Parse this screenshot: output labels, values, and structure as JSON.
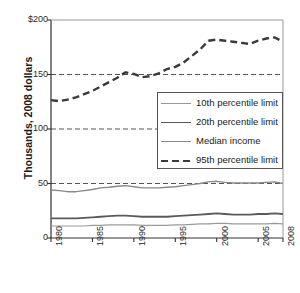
{
  "chart_data": {
    "type": "line",
    "title": "",
    "xlabel": "",
    "ylabel": "Thousands, 2008 dollars",
    "xlim": [
      1980,
      2008
    ],
    "ylim": [
      0,
      200
    ],
    "grid": "horizontal dashed at 50, 100, 150",
    "legend_position": "center-right",
    "y_ticks": [
      {
        "value": 0,
        "label": "0"
      },
      {
        "value": 50,
        "label": "50"
      },
      {
        "value": 100,
        "label": "100"
      },
      {
        "value": 150,
        "label": "150"
      },
      {
        "value": 200,
        "label": "$200"
      }
    ],
    "x_ticks": [
      {
        "value": 1980,
        "label": "1980"
      },
      {
        "value": 1985,
        "label": "1985"
      },
      {
        "value": 1990,
        "label": "1990"
      },
      {
        "value": 1995,
        "label": "1995"
      },
      {
        "value": 2000,
        "label": "2000"
      },
      {
        "value": 2005,
        "label": "2005"
      },
      {
        "value": 2008,
        "label": "2008"
      }
    ],
    "x": [
      1980,
      1981,
      1982,
      1983,
      1984,
      1985,
      1986,
      1987,
      1988,
      1989,
      1990,
      1991,
      1992,
      1993,
      1994,
      1995,
      1996,
      1997,
      1998,
      1999,
      2000,
      2001,
      2002,
      2003,
      2004,
      2005,
      2006,
      2007,
      2008
    ],
    "series": [
      {
        "name": "10th percentile limit",
        "color": "#9a9a9a",
        "width": 1.2,
        "dash": "none",
        "values": [
          11,
          11,
          11,
          11,
          11,
          11.5,
          11.5,
          12,
          12,
          12,
          12,
          11.5,
          11.5,
          11.5,
          11.5,
          12,
          12,
          12.5,
          13,
          13,
          13.5,
          13.5,
          13,
          13,
          13,
          13,
          13,
          13.5,
          13
        ]
      },
      {
        "name": "20th percentile limit",
        "color": "#5a5a5a",
        "width": 1.8,
        "dash": "none",
        "values": [
          18,
          18,
          18,
          18,
          18.5,
          19,
          19.5,
          20,
          20.5,
          20.5,
          20,
          19.5,
          19.5,
          19.5,
          19.5,
          20,
          20.5,
          21,
          21.5,
          22,
          22.5,
          22,
          21.5,
          21.5,
          21.5,
          22,
          22,
          22.5,
          22
        ]
      },
      {
        "name": "Median income",
        "color": "#888888",
        "width": 1.4,
        "dash": "none",
        "values": [
          44,
          43.5,
          42.5,
          42.5,
          43.5,
          44.5,
          46,
          46.5,
          47.5,
          48,
          47,
          46,
          46,
          46,
          46.5,
          47,
          48,
          49,
          50,
          51.5,
          52,
          51,
          50.5,
          50.5,
          50.5,
          50.5,
          51,
          51.5,
          50
        ]
      },
      {
        "name": "95th percentile limit",
        "color": "#3a3a3a",
        "width": 2.4,
        "dash": "7,4",
        "values": [
          126.5,
          125.5,
          127,
          129,
          132,
          135,
          139,
          143,
          147,
          152,
          150.5,
          147.5,
          148.5,
          151,
          155,
          157,
          161,
          167,
          173,
          181,
          182,
          181,
          180,
          179,
          178,
          181,
          183,
          184,
          180
        ]
      }
    ]
  },
  "plot": {
    "left": 51,
    "right": 283,
    "top": 20,
    "bottom": 238
  },
  "legend": {
    "box": {
      "left": 157,
      "top": 92,
      "width": 126,
      "height": 77
    },
    "items": [
      {
        "label": "10th percentile limit"
      },
      {
        "label": "20th percentile limit"
      },
      {
        "label": "Median income"
      },
      {
        "label": "95th percentile limit"
      }
    ]
  }
}
